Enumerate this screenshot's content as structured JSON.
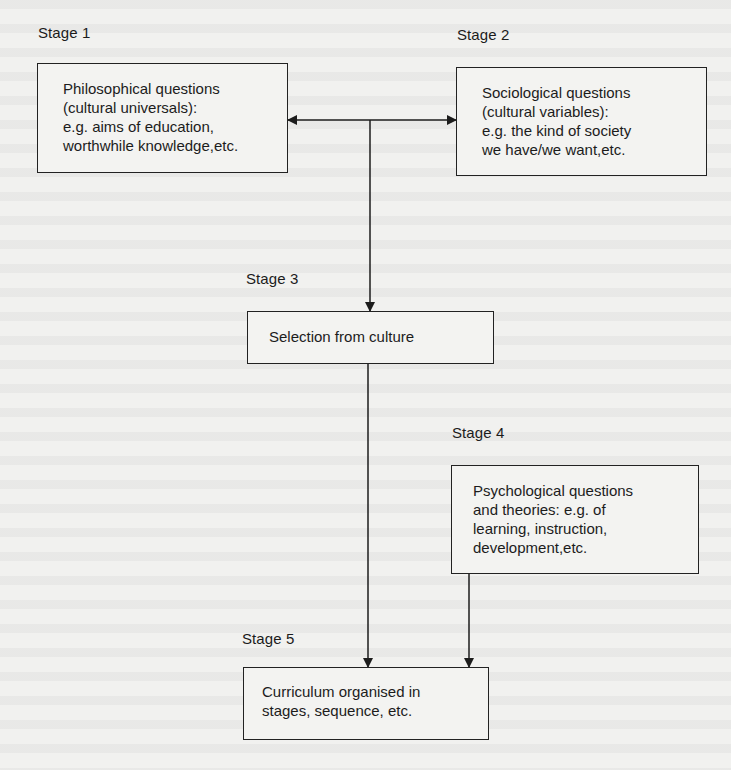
{
  "diagram": {
    "stages": [
      {
        "id": 1,
        "label": "Stage 1",
        "lines": [
          "Philosophical questions",
          "(cultural universals):",
          "e.g. aims of education,",
          "worthwhile knowledge,etc."
        ]
      },
      {
        "id": 2,
        "label": "Stage 2",
        "lines": [
          "Sociological questions",
          "(cultural variables):",
          "e.g. the kind of society",
          "we have/we want,etc."
        ]
      },
      {
        "id": 3,
        "label": "Stage 3",
        "lines": [
          "Selection from culture"
        ]
      },
      {
        "id": 4,
        "label": "Stage 4",
        "lines": [
          "Psychological questions",
          "and theories: e.g. of",
          "learning, instruction,",
          "development,etc."
        ]
      },
      {
        "id": 5,
        "label": "Stage 5",
        "lines": [
          "Curriculum organised in",
          "stages, sequence, etc."
        ]
      }
    ],
    "connections": [
      {
        "from": "stage-1/stage-2 link",
        "to": "Stage 1",
        "type": "arrow"
      },
      {
        "from": "stage-1/stage-2 link",
        "to": "Stage 2",
        "type": "arrow"
      },
      {
        "from": "stage-1/stage-2 link",
        "to": "Stage 3",
        "type": "arrow"
      },
      {
        "from": "Stage 3",
        "to": "Stage 5",
        "type": "arrow"
      },
      {
        "from": "Stage 4",
        "to": "Stage 5",
        "type": "arrow"
      }
    ],
    "colors": {
      "background": "#f1f1ef",
      "ink": "#1c1c1c"
    }
  }
}
